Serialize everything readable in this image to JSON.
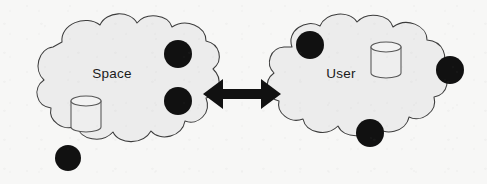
{
  "diagram": {
    "type": "cloud-interaction-diagram",
    "background_color": "#f7f7f6",
    "canvas": {
      "width": 487,
      "height": 184
    },
    "clouds": [
      {
        "id": "space-cloud",
        "label": "Space",
        "label_x": 112,
        "label_y": 74,
        "fill_color": "#ececec",
        "stroke_color": "#3c3c3c",
        "nodes": [
          {
            "id": "space-node-1",
            "cx": 178,
            "cy": 54,
            "r": 14,
            "color": "#111111"
          },
          {
            "id": "space-node-2",
            "cx": 178,
            "cy": 101,
            "r": 14,
            "color": "#111111"
          },
          {
            "id": "space-node-3",
            "cx": 68,
            "cy": 158,
            "r": 13,
            "color": "#111111"
          }
        ],
        "databases": [
          {
            "id": "space-database",
            "x": 71,
            "y": 96,
            "width": 30,
            "height": 36,
            "ellipse_ry": 5
          }
        ]
      },
      {
        "id": "user-cloud",
        "label": "User",
        "label_x": 341,
        "label_y": 74,
        "fill_color": "#ececec",
        "stroke_color": "#3c3c3c",
        "nodes": [
          {
            "id": "user-node-1",
            "cx": 310,
            "cy": 45,
            "r": 14,
            "color": "#111111"
          },
          {
            "id": "user-node-2",
            "cx": 450,
            "cy": 70,
            "r": 14,
            "color": "#111111"
          },
          {
            "id": "user-node-3",
            "cx": 370,
            "cy": 133,
            "r": 14,
            "color": "#111111"
          }
        ],
        "databases": [
          {
            "id": "user-database",
            "x": 371,
            "y": 42,
            "width": 30,
            "height": 36,
            "ellipse_ry": 5
          }
        ]
      }
    ],
    "connector": {
      "id": "space-user-link",
      "style": "double-headed-arrow",
      "color": "#111111",
      "x_start": 203,
      "x_end": 281,
      "y": 94,
      "shaft_thickness": 10,
      "head_length": 20,
      "head_width": 30
    }
  }
}
